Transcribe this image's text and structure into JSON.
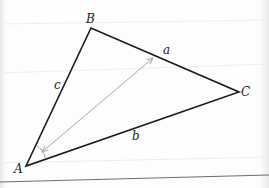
{
  "diagram": {
    "vertices": [
      {
        "name": "A",
        "label": "A",
        "x": 26,
        "y": 166,
        "label_x": 14,
        "label_y": 173
      },
      {
        "name": "B",
        "label": "B",
        "x": 91,
        "y": 28,
        "label_x": 86,
        "label_y": 23
      },
      {
        "name": "C",
        "label": "C",
        "x": 239,
        "y": 92,
        "label_x": 241,
        "label_y": 96
      }
    ],
    "sides": [
      {
        "name": "a",
        "label": "a",
        "from": "B",
        "to": "C",
        "label_x": 163,
        "label_y": 54
      },
      {
        "name": "b",
        "label": "b",
        "from": "A",
        "to": "C",
        "label_x": 132,
        "label_y": 140
      },
      {
        "name": "c",
        "label": "c",
        "from": "A",
        "to": "B",
        "label_x": 54,
        "label_y": 89
      }
    ],
    "arrow": {
      "description": "double-headed gray arrow from near A toward side a",
      "x1": 42,
      "y1": 152,
      "x2": 153,
      "y2": 58,
      "color": "#a8a8a8"
    },
    "angle_mark": {
      "vertex": "A",
      "color": "#999999"
    },
    "colors": {
      "triangle_stroke": "#1a1a1a",
      "baseline": "#6e6e6e",
      "faint_line": "#ececec",
      "label": "#222222"
    }
  }
}
